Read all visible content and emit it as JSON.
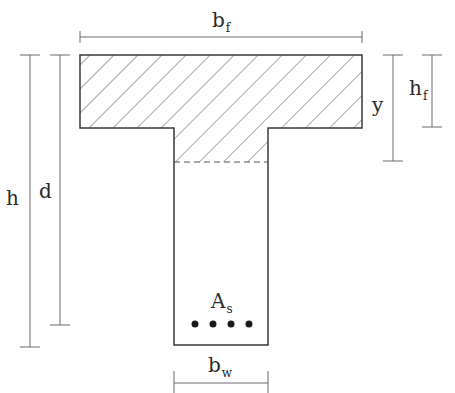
{
  "diagram": {
    "type": "T-beam cross-section",
    "colors": {
      "stroke": "#3a3a3a",
      "hatch": "#555555",
      "dim_line": "#6a6a6a",
      "text": "#2a2a2a"
    },
    "labels": {
      "flange_width": {
        "main": "b",
        "sub": "f"
      },
      "web_width": {
        "main": "b",
        "sub": "w"
      },
      "total_height": {
        "main": "h"
      },
      "effective_depth": {
        "main": "d"
      },
      "compression_depth": {
        "main": "y"
      },
      "flange_thickness": {
        "main": "h",
        "sub": "f"
      },
      "steel_area": {
        "main": "A",
        "sub": "s"
      }
    },
    "rebar_count": 4,
    "regions": [
      "flange (hatched)",
      "web compression zone (hatched, dashed bottom)",
      "web"
    ]
  }
}
